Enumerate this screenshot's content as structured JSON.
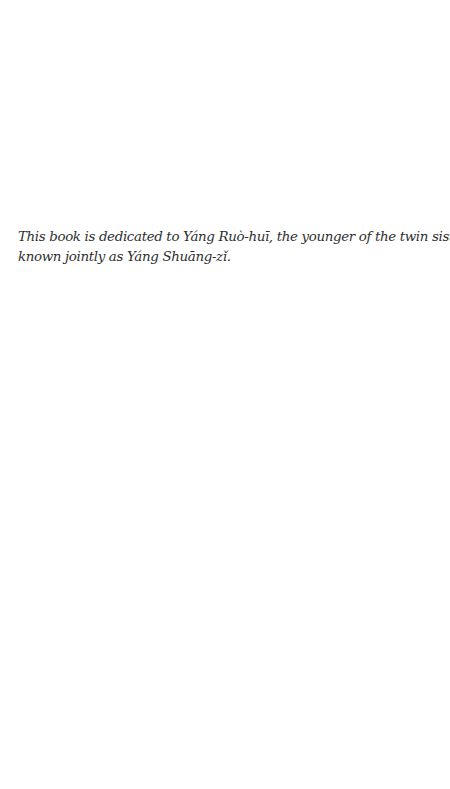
{
  "page": {
    "dedication": {
      "lines": [
        "This book is dedicated to Yáng Ruò-huī, the younger of the twin sisters",
        "known jointly as Yáng Shuāng-zǐ."
      ]
    }
  }
}
